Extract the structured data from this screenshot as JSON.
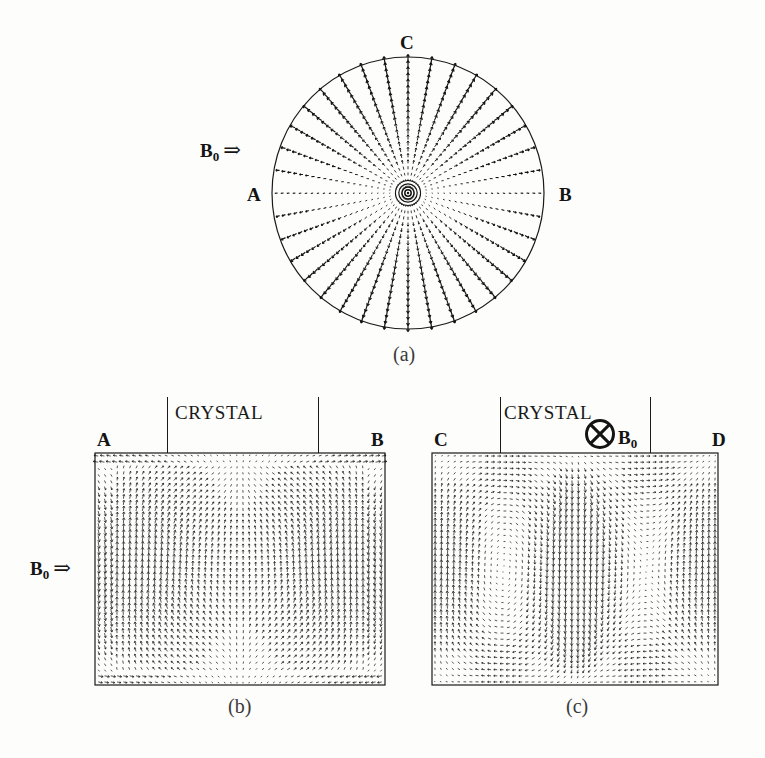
{
  "figure": {
    "background": "#fdfdfc",
    "ink": "#141414",
    "width": 765,
    "height": 758
  },
  "panel_a": {
    "caption": "(a)",
    "field_label": "B",
    "field_sub": "0",
    "field_arrow": "⇒",
    "label_top": "C",
    "label_left": "A",
    "label_right": "B",
    "geometry": {
      "cx": 408,
      "cy": 193,
      "r": 136,
      "spokes": 36,
      "glyphs_per_spoke": 22
    }
  },
  "panel_b": {
    "caption": "(b)",
    "crystal_label": "CRYSTAL",
    "field_label": "B",
    "field_sub": "0",
    "field_arrow": "⇒",
    "label_left": "A",
    "label_right": "B",
    "geometry": {
      "x": 95,
      "y": 453,
      "w": 290,
      "h": 232,
      "cols": 46,
      "rows": 38,
      "tick_left_x": 167,
      "tick_right_x": 318
    }
  },
  "panel_c": {
    "caption": "(c)",
    "crystal_label": "CRYSTAL",
    "field_symbol": "circle-cross-into-page",
    "field_label": "B",
    "field_sub": "0",
    "label_left": "C",
    "label_right": "D",
    "geometry": {
      "x": 432,
      "y": 453,
      "w": 286,
      "h": 232,
      "cols": 46,
      "rows": 38,
      "tick_left_x": 500,
      "tick_right_x": 650,
      "symbol_cx": 600,
      "symbol_cy": 434,
      "symbol_r": 14
    }
  },
  "chart_data": {
    "type": "vector-field",
    "panels": [
      {
        "id": "a",
        "caption": "(a)",
        "domain": "circular cross-section",
        "pattern": "radial / axisymmetric vectors converging on center",
        "annotations": [
          "C",
          "A",
          "B",
          "B0 ⇒"
        ],
        "field_direction": "transverse, left to right",
        "center": [
          408,
          193
        ],
        "radius": 136
      },
      {
        "id": "b",
        "caption": "(b)",
        "domain": "rectangular cross-section",
        "pattern": "dense near-vertical vectors, two broad upwelling cells, downflow at side walls",
        "annotations": [
          "CRYSTAL",
          "A",
          "B",
          "B0 ⇒"
        ],
        "field_direction": "horizontal, left to right (in plane)",
        "box": [
          95,
          453,
          290,
          232
        ]
      },
      {
        "id": "c",
        "caption": "(c)",
        "domain": "rectangular cross-section",
        "pattern": "two mirror-symmetric counter-rotating vortices with strong central upward jet",
        "annotations": [
          "CRYSTAL",
          "C",
          "D",
          "⊗ B0"
        ],
        "field_direction": "into the page",
        "box": [
          432,
          453,
          286,
          232
        ]
      }
    ]
  }
}
